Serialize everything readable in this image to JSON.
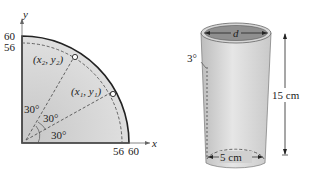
{
  "left_figure": {
    "axis_x_label": "x",
    "axis_y_label": "y",
    "y_ticks": [
      "60",
      "56"
    ],
    "x_ticks": [
      "56",
      "60"
    ],
    "point1": "(x₁, y₁)",
    "point2": "(x₂, y₂)",
    "angles": [
      "30°",
      "30°",
      "30°"
    ]
  },
  "right_figure": {
    "top_label": "d",
    "angle_label": "3°",
    "height_label": "15 cm",
    "bottom_label": "5 cm"
  },
  "colors": {
    "fill_gray": "#d4d4d4",
    "stroke": "#222222"
  }
}
